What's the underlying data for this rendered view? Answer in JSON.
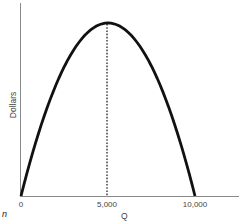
{
  "chart_data": {
    "type": "line",
    "title": "",
    "xlabel": "Q",
    "ylabel": "Dollars",
    "x_ticks": [
      "0",
      "5,000",
      "10,000"
    ],
    "xlim": [
      0,
      12000
    ],
    "series": [
      {
        "name": "Dollars vs Q (inverted parabola)",
        "x": [
          0,
          1000,
          2000,
          3000,
          4000,
          5000,
          6000,
          7000,
          8000,
          9000,
          10000
        ],
        "y": [
          0,
          0.36,
          0.64,
          0.84,
          0.96,
          1.0,
          0.96,
          0.84,
          0.64,
          0.36,
          0
        ],
        "color": "#111111"
      }
    ],
    "annotations": [
      {
        "type": "dashed-vertical-line",
        "x": 5000,
        "from_y": 0,
        "to_y": 1.0,
        "label": "maximum at Q = 5,000"
      }
    ],
    "grid": false,
    "legend": null,
    "y_ticks": []
  },
  "labels": {
    "x_axis": "Q",
    "y_axis": "Dollars",
    "corner": "n",
    "ticks": {
      "t0": "0",
      "t1": "5,000",
      "t2": "10,000"
    }
  },
  "colors": {
    "curve": "#111111",
    "axis": "#888888",
    "text": "#444444"
  }
}
